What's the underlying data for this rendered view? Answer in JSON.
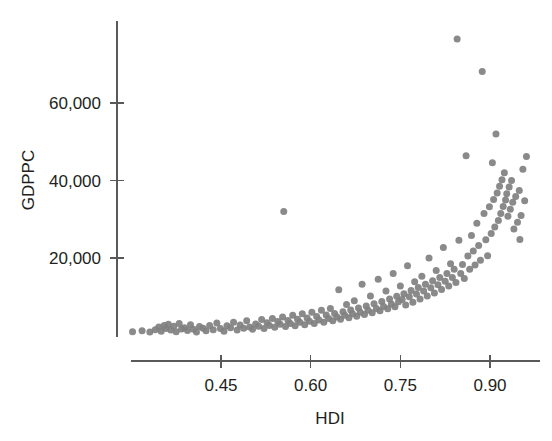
{
  "chart_data": {
    "type": "scatter",
    "title": "",
    "xlabel": "HDI",
    "ylabel": "GDPPC",
    "xlim": [
      0.285,
      0.975
    ],
    "ylim": [
      0,
      82000
    ],
    "grid": false,
    "legend": null,
    "marker": {
      "color": "#808080",
      "shape": "circle",
      "size_px": 7
    },
    "xticks": [
      0.45,
      0.6,
      0.75,
      0.9
    ],
    "xtick_labels": [
      "0.45",
      "0.60",
      "0.75",
      "0.90"
    ],
    "yticks": [
      20000,
      40000,
      60000
    ],
    "ytick_labels": [
      "20,000",
      "40,000",
      "60,000"
    ],
    "n_points": 178,
    "points": [
      [
        0.302,
        1000
      ],
      [
        0.318,
        1200
      ],
      [
        0.331,
        900
      ],
      [
        0.34,
        1500
      ],
      [
        0.346,
        2200
      ],
      [
        0.35,
        1100
      ],
      [
        0.355,
        2600
      ],
      [
        0.358,
        1800
      ],
      [
        0.362,
        2900
      ],
      [
        0.366,
        1400
      ],
      [
        0.371,
        2400
      ],
      [
        0.375,
        1000
      ],
      [
        0.38,
        3100
      ],
      [
        0.384,
        1700
      ],
      [
        0.389,
        2000
      ],
      [
        0.394,
        1300
      ],
      [
        0.399,
        2800
      ],
      [
        0.404,
        1600
      ],
      [
        0.409,
        900
      ],
      [
        0.414,
        2300
      ],
      [
        0.42,
        1900
      ],
      [
        0.425,
        1200
      ],
      [
        0.431,
        2600
      ],
      [
        0.437,
        1500
      ],
      [
        0.443,
        3200
      ],
      [
        0.449,
        1800
      ],
      [
        0.455,
        1100
      ],
      [
        0.46,
        2500
      ],
      [
        0.466,
        2000
      ],
      [
        0.471,
        3400
      ],
      [
        0.477,
        1400
      ],
      [
        0.482,
        2700
      ],
      [
        0.488,
        1900
      ],
      [
        0.493,
        3800
      ],
      [
        0.498,
        2200
      ],
      [
        0.503,
        1600
      ],
      [
        0.508,
        3000
      ],
      [
        0.513,
        2400
      ],
      [
        0.518,
        4100
      ],
      [
        0.522,
        1800
      ],
      [
        0.527,
        3300
      ],
      [
        0.531,
        2600
      ],
      [
        0.536,
        4400
      ],
      [
        0.54,
        2100
      ],
      [
        0.545,
        3600
      ],
      [
        0.549,
        2900
      ],
      [
        0.553,
        4800
      ],
      [
        0.555,
        32000
      ],
      [
        0.558,
        2300
      ],
      [
        0.562,
        3900
      ],
      [
        0.566,
        3100
      ],
      [
        0.57,
        5200
      ],
      [
        0.574,
        2500
      ],
      [
        0.578,
        4200
      ],
      [
        0.582,
        3400
      ],
      [
        0.586,
        5600
      ],
      [
        0.59,
        2800
      ],
      [
        0.594,
        4500
      ],
      [
        0.598,
        3700
      ],
      [
        0.602,
        6000
      ],
      [
        0.606,
        3100
      ],
      [
        0.61,
        4900
      ],
      [
        0.614,
        4000
      ],
      [
        0.618,
        6500
      ],
      [
        0.622,
        3400
      ],
      [
        0.626,
        5300
      ],
      [
        0.63,
        4400
      ],
      [
        0.633,
        7000
      ],
      [
        0.637,
        3800
      ],
      [
        0.64,
        5700
      ],
      [
        0.644,
        4800
      ],
      [
        0.647,
        11800
      ],
      [
        0.65,
        4200
      ],
      [
        0.654,
        6100
      ],
      [
        0.657,
        5200
      ],
      [
        0.66,
        8000
      ],
      [
        0.664,
        4600
      ],
      [
        0.667,
        6600
      ],
      [
        0.67,
        5600
      ],
      [
        0.673,
        9000
      ],
      [
        0.677,
        5000
      ],
      [
        0.68,
        7100
      ],
      [
        0.683,
        6000
      ],
      [
        0.686,
        13200
      ],
      [
        0.69,
        5400
      ],
      [
        0.693,
        7600
      ],
      [
        0.696,
        6500
      ],
      [
        0.7,
        10200
      ],
      [
        0.703,
        5900
      ],
      [
        0.706,
        8200
      ],
      [
        0.71,
        7000
      ],
      [
        0.713,
        14500
      ],
      [
        0.716,
        6400
      ],
      [
        0.719,
        8800
      ],
      [
        0.722,
        7500
      ],
      [
        0.726,
        11500
      ],
      [
        0.729,
        6900
      ],
      [
        0.732,
        9400
      ],
      [
        0.735,
        8100
      ],
      [
        0.738,
        16000
      ],
      [
        0.741,
        7400
      ],
      [
        0.744,
        10100
      ],
      [
        0.747,
        8700
      ],
      [
        0.75,
        12800
      ],
      [
        0.753,
        9300
      ],
      [
        0.756,
        10800
      ],
      [
        0.759,
        7900
      ],
      [
        0.762,
        18000
      ],
      [
        0.765,
        10000
      ],
      [
        0.768,
        11600
      ],
      [
        0.771,
        8600
      ],
      [
        0.774,
        13900
      ],
      [
        0.777,
        10700
      ],
      [
        0.78,
        12400
      ],
      [
        0.783,
        9400
      ],
      [
        0.786,
        15300
      ],
      [
        0.789,
        11500
      ],
      [
        0.792,
        13200
      ],
      [
        0.795,
        10200
      ],
      [
        0.798,
        20000
      ],
      [
        0.801,
        12300
      ],
      [
        0.804,
        14100
      ],
      [
        0.807,
        11000
      ],
      [
        0.81,
        16800
      ],
      [
        0.813,
        13100
      ],
      [
        0.816,
        15000
      ],
      [
        0.819,
        11900
      ],
      [
        0.822,
        22700
      ],
      [
        0.825,
        14000
      ],
      [
        0.828,
        16000
      ],
      [
        0.831,
        12800
      ],
      [
        0.834,
        18500
      ],
      [
        0.837,
        15000
      ],
      [
        0.84,
        17100
      ],
      [
        0.843,
        13700
      ],
      [
        0.845,
        76500
      ],
      [
        0.848,
        24600
      ],
      [
        0.851,
        16000
      ],
      [
        0.854,
        18300
      ],
      [
        0.857,
        14700
      ],
      [
        0.86,
        46400
      ],
      [
        0.863,
        20500
      ],
      [
        0.866,
        17100
      ],
      [
        0.869,
        25800
      ],
      [
        0.872,
        21800
      ],
      [
        0.875,
        18200
      ],
      [
        0.878,
        29000
      ],
      [
        0.881,
        23200
      ],
      [
        0.884,
        19400
      ],
      [
        0.887,
        68100
      ],
      [
        0.89,
        31500
      ],
      [
        0.893,
        24700
      ],
      [
        0.896,
        20600
      ],
      [
        0.899,
        33200
      ],
      [
        0.902,
        26300
      ],
      [
        0.904,
        44600
      ],
      [
        0.906,
        35100
      ],
      [
        0.908,
        28000
      ],
      [
        0.91,
        52000
      ],
      [
        0.912,
        36800
      ],
      [
        0.914,
        29700
      ],
      [
        0.916,
        38500
      ],
      [
        0.918,
        31500
      ],
      [
        0.92,
        40200
      ],
      [
        0.922,
        33300
      ],
      [
        0.924,
        42000
      ],
      [
        0.926,
        35000
      ],
      [
        0.928,
        36600
      ],
      [
        0.93,
        30800
      ],
      [
        0.932,
        38300
      ],
      [
        0.934,
        32600
      ],
      [
        0.936,
        40000
      ],
      [
        0.938,
        34400
      ],
      [
        0.94,
        27500
      ],
      [
        0.943,
        35900
      ],
      [
        0.946,
        29200
      ],
      [
        0.949,
        37400
      ],
      [
        0.952,
        31000
      ],
      [
        0.955,
        42900
      ],
      [
        0.958,
        34800
      ],
      [
        0.961,
        46200
      ],
      [
        0.95,
        24800
      ]
    ]
  }
}
